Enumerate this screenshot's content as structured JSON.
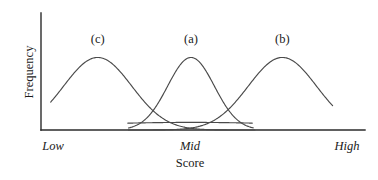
{
  "figure": {
    "name": "score-frequency-distributions",
    "background_color": "#ffffff",
    "axis_color": "#2b2b2b",
    "curve_color": "#4a4a4a"
  },
  "axes": {
    "y_title": "Frequency",
    "x_title": "Score",
    "x_tick_labels": [
      "Low",
      "Mid",
      "High"
    ]
  },
  "curve_labels": {
    "left": "(c)",
    "middle": "(a)",
    "right": "(b)"
  },
  "chart_data": {
    "type": "line",
    "title": "",
    "subtitle": "",
    "xlabel": "Score",
    "ylabel": "Frequency",
    "xlim": [
      0,
      1
    ],
    "ylim": [
      0,
      1
    ],
    "grid": false,
    "legend": "inline-curve-labels",
    "xticks": [
      0.03,
      0.46,
      0.9
    ],
    "xticklabels": [
      "Low",
      "Mid",
      "High"
    ],
    "yticks": [],
    "yticklabels": [],
    "annotations": [
      {
        "text": "(c)",
        "x": 0.175,
        "y": 0.93
      },
      {
        "text": "(a)",
        "x": 0.463,
        "y": 0.93
      },
      {
        "text": "(b)",
        "x": 0.745,
        "y": 0.93
      }
    ],
    "series": [
      {
        "name": "(c)",
        "label": "(c)",
        "shape": "normal",
        "mean": 0.175,
        "stdev": 0.105,
        "peak_height": 0.62,
        "x_start": 0.03,
        "x_end": 0.66,
        "description": "Bell curve centered near Low end of score range"
      },
      {
        "name": "(a)",
        "label": "(a)",
        "shape": "normal",
        "mean": 0.463,
        "stdev": 0.072,
        "peak_height": 0.62,
        "x_start": 0.27,
        "x_end": 0.655,
        "description": "Narrower bell curve centered at Mid score"
      },
      {
        "name": "(b)",
        "label": "(b)",
        "shape": "normal",
        "mean": 0.745,
        "stdev": 0.105,
        "peak_height": 0.62,
        "x_start": 0.27,
        "x_end": 0.9,
        "description": "Bell curve centered near High end of score range"
      },
      {
        "name": "flat",
        "label": "",
        "shape": "flat-wide",
        "mean": 0.463,
        "stdev": 0.42,
        "peak_height": 0.065,
        "x_start": 0.268,
        "x_end": 0.652,
        "description": "Very wide low-amplitude curve hugging the baseline between Low and High"
      }
    ]
  }
}
